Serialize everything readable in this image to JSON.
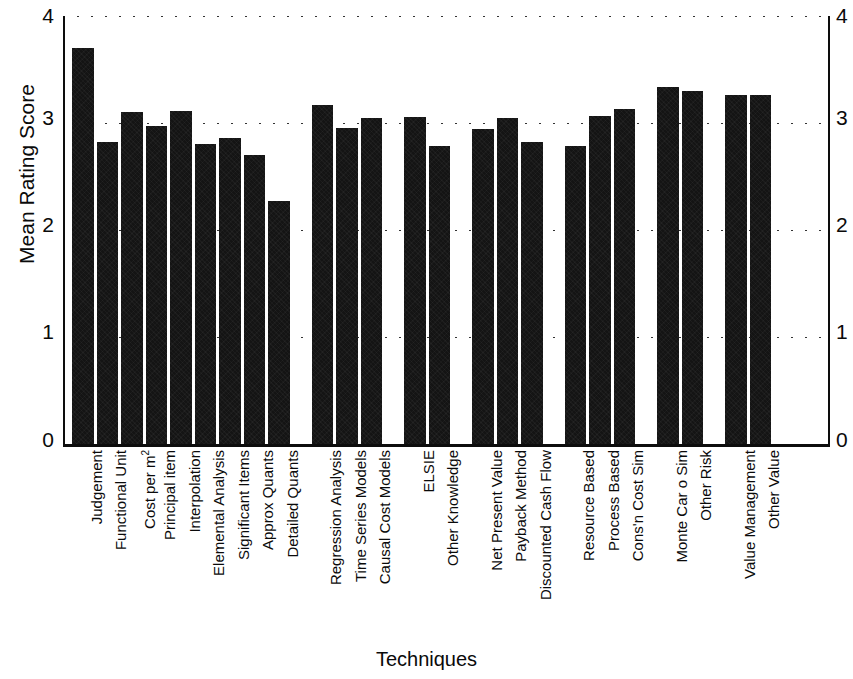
{
  "chart_data": {
    "type": "bar",
    "title": "",
    "xlabel": "Techniques",
    "ylabel": "Mean Rating Score",
    "ylim": [
      0,
      4
    ],
    "yticks": [
      "0",
      "1",
      "2",
      "3",
      "4"
    ],
    "grid": true,
    "legend": "none",
    "mirrored_y_axis": true,
    "bar_color": "#141414",
    "categories": [
      "Judgement",
      "Functional Unit",
      "Cost per m²",
      "Principal item",
      "Interpolation",
      "Elemental Analysis",
      "Significant Items",
      "Approx Quants",
      "Detailed Quants",
      "Regression Analysis",
      "Time Series Models",
      "Causal Cost Models",
      "ELSIE",
      "Other Knowledge",
      "Net Present Value",
      "Payback Method",
      "Discounted Cash Flow",
      "Resource Based",
      "Process Based",
      "Cons'n Cost Sim",
      "Monte Car o Sim",
      "Other Risk",
      "Value Management",
      "Other Value"
    ],
    "values": [
      3.7,
      2.82,
      3.1,
      2.97,
      3.11,
      2.8,
      2.86,
      2.7,
      2.27,
      3.17,
      2.95,
      3.05,
      3.06,
      2.79,
      2.94,
      3.05,
      2.82,
      2.79,
      3.07,
      3.13,
      3.34,
      3.3,
      3.26,
      3.26
    ],
    "group_breaks_after": [
      8,
      11,
      13,
      16,
      19,
      21
    ],
    "groups": [
      {
        "name": "Traditional",
        "categories": [
          "Judgement",
          "Functional Unit",
          "Cost per m²",
          "Principal item",
          "Interpolation",
          "Elemental Analysis",
          "Significant Items",
          "Approx Quants",
          "Detailed Quants"
        ]
      },
      {
        "name": "Statistical",
        "categories": [
          "Regression Analysis",
          "Time Series Models",
          "Causal Cost Models"
        ]
      },
      {
        "name": "Knowledge",
        "categories": [
          "ELSIE",
          "Other Knowledge"
        ]
      },
      {
        "name": "Investment",
        "categories": [
          "Net Present Value",
          "Payback Method",
          "Discounted Cash Flow"
        ]
      },
      {
        "name": "Simulation",
        "categories": [
          "Resource Based",
          "Process Based",
          "Cons'n Cost Sim"
        ]
      },
      {
        "name": "Risk",
        "categories": [
          "Monte Car o Sim",
          "Other Risk"
        ]
      },
      {
        "name": "Value",
        "categories": [
          "Value Management",
          "Other Value"
        ]
      }
    ]
  },
  "axes": {
    "y_left_ticks": [
      "4",
      "3",
      "2",
      "1",
      "0"
    ],
    "y_right_ticks": [
      "4",
      "3",
      "2",
      "1",
      "0"
    ],
    "y_axis_title": "Mean Rating Score",
    "x_axis_title": "Techniques"
  }
}
